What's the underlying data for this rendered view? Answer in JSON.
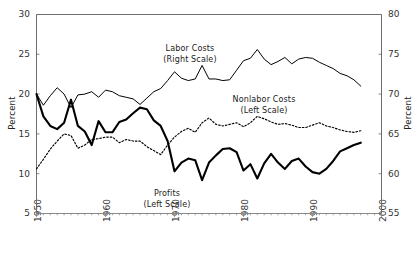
{
  "chart_data": {
    "type": "line",
    "title": "",
    "xlabel": "",
    "ylabel": "Percent",
    "ylabel_right": "Percent",
    "xlim": [
      1950,
      2000
    ],
    "ylim": [
      5,
      30
    ],
    "ylim_right": [
      55,
      80
    ],
    "grid": false,
    "legend": "inline-annotations",
    "x_ticks": [
      "1950",
      "1960",
      "1970",
      "1980",
      "1990",
      "2000"
    ],
    "y_ticks_left": [
      "5",
      "10",
      "15",
      "20",
      "25",
      "30"
    ],
    "y_ticks_right": [
      "55",
      "60",
      "65",
      "70",
      "75",
      "80"
    ],
    "annotations": [
      {
        "name": "labor-costs",
        "line1": "Labor Costs",
        "line2": "(Right Scale)"
      },
      {
        "name": "nonlabor-costs",
        "line1": "Nonlabor Costs",
        "line2": "(Left Scale)"
      },
      {
        "name": "profits",
        "line1": "Profits",
        "line2": "(Left Scale)"
      }
    ],
    "series": [
      {
        "name": "Labor Costs",
        "scale": "right",
        "style": "thin-solid",
        "color": "#000000",
        "x": [
          1950,
          1951,
          1952,
          1953,
          1954,
          1955,
          1956,
          1957,
          1958,
          1959,
          1960,
          1961,
          1962,
          1963,
          1964,
          1965,
          1966,
          1967,
          1968,
          1969,
          1970,
          1971,
          1972,
          1973,
          1974,
          1975,
          1976,
          1977,
          1978,
          1979,
          1980,
          1981,
          1982,
          1983,
          1984,
          1985,
          1986,
          1987,
          1988,
          1989,
          1990,
          1991,
          1992,
          1993,
          1994,
          1995,
          1996,
          1997
        ],
        "values": [
          70.0,
          68.6,
          69.8,
          70.8,
          70.0,
          68.3,
          69.9,
          70.0,
          70.3,
          69.6,
          70.5,
          70.3,
          69.8,
          69.6,
          69.4,
          68.7,
          69.5,
          70.3,
          70.7,
          71.7,
          72.8,
          72.0,
          71.7,
          71.9,
          73.6,
          71.9,
          71.9,
          71.7,
          71.8,
          73.0,
          74.2,
          74.5,
          75.6,
          74.4,
          73.7,
          74.1,
          74.6,
          73.8,
          74.4,
          74.6,
          74.5,
          74.0,
          73.6,
          73.2,
          72.6,
          72.3,
          71.8,
          71.0
        ]
      },
      {
        "name": "Profits",
        "scale": "left",
        "style": "bold-solid",
        "color": "#000000",
        "x": [
          1950,
          1951,
          1952,
          1953,
          1954,
          1955,
          1956,
          1957,
          1958,
          1959,
          1960,
          1961,
          1962,
          1963,
          1964,
          1965,
          1966,
          1967,
          1968,
          1969,
          1970,
          1971,
          1972,
          1973,
          1974,
          1975,
          1976,
          1977,
          1978,
          1979,
          1980,
          1981,
          1982,
          1983,
          1984,
          1985,
          1986,
          1987,
          1988,
          1989,
          1990,
          1991,
          1992,
          1993,
          1994,
          1995,
          1996,
          1997
        ],
        "values": [
          20.0,
          17.2,
          16.0,
          15.6,
          16.4,
          19.3,
          16.0,
          15.3,
          13.6,
          16.6,
          15.2,
          15.2,
          16.5,
          16.8,
          17.6,
          18.3,
          18.1,
          16.7,
          16.0,
          14.1,
          10.3,
          11.4,
          11.9,
          11.7,
          9.2,
          11.4,
          12.3,
          13.1,
          13.2,
          12.7,
          10.4,
          11.2,
          9.4,
          11.3,
          12.5,
          11.4,
          10.6,
          11.6,
          11.9,
          10.9,
          10.2,
          10.0,
          10.6,
          11.6,
          12.8,
          13.2,
          13.6,
          13.9
        ]
      },
      {
        "name": "Nonlabor Costs",
        "scale": "left",
        "style": "dotted",
        "color": "#000000",
        "x": [
          1950,
          1951,
          1952,
          1953,
          1954,
          1955,
          1956,
          1957,
          1958,
          1959,
          1960,
          1961,
          1962,
          1963,
          1964,
          1965,
          1966,
          1967,
          1968,
          1969,
          1970,
          1971,
          1972,
          1973,
          1974,
          1975,
          1976,
          1977,
          1978,
          1979,
          1980,
          1981,
          1982,
          1983,
          1984,
          1985,
          1986,
          1987,
          1988,
          1989,
          1990,
          1991,
          1992,
          1993,
          1994,
          1995,
          1996,
          1997
        ],
        "values": [
          10.6,
          11.8,
          13.1,
          14.1,
          15.0,
          14.8,
          13.2,
          13.6,
          14.3,
          14.4,
          14.6,
          14.6,
          13.9,
          14.3,
          14.1,
          14.1,
          13.4,
          12.9,
          12.4,
          13.6,
          14.6,
          15.3,
          15.7,
          15.2,
          16.4,
          17.0,
          16.2,
          16.0,
          16.2,
          16.4,
          15.9,
          16.4,
          17.2,
          16.9,
          16.5,
          16.2,
          16.3,
          16.1,
          15.8,
          15.8,
          16.1,
          16.4,
          16.0,
          15.8,
          15.5,
          15.3,
          15.2,
          15.4
        ]
      }
    ]
  }
}
